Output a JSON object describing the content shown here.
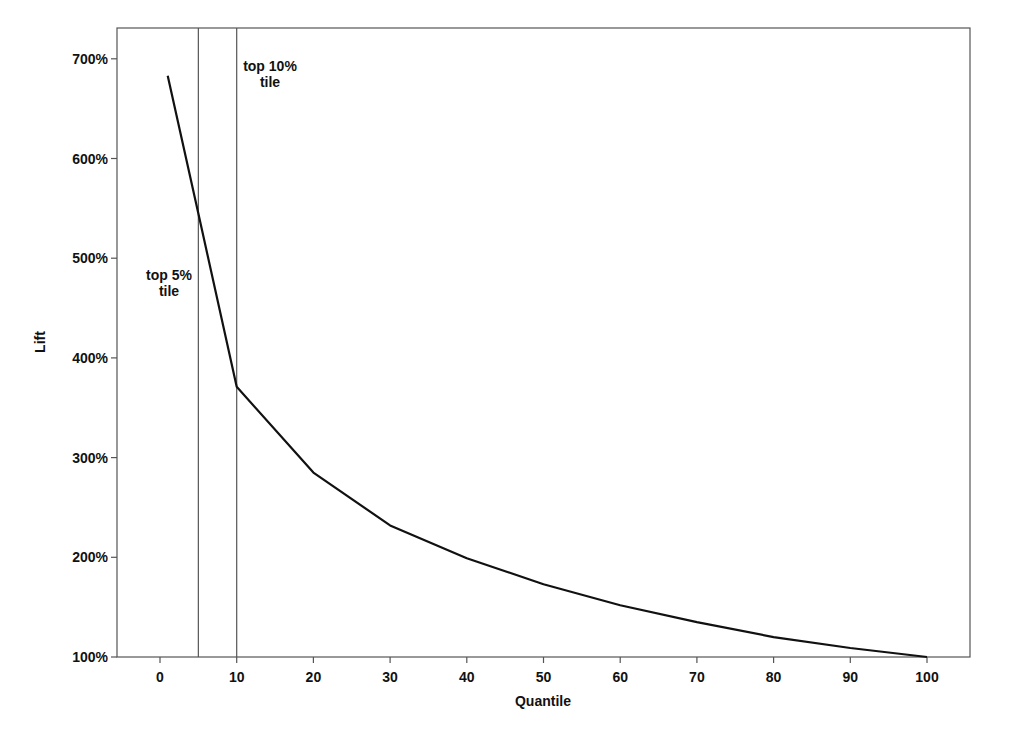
{
  "chart_data": {
    "type": "line",
    "title": "",
    "xlabel": "Quantile",
    "ylabel": "Lift",
    "x": [
      1,
      5,
      10,
      20,
      30,
      40,
      50,
      60,
      70,
      80,
      90,
      100
    ],
    "series": [
      {
        "name": "Lift",
        "values": [
          683,
          545,
          371,
          285,
          232,
          199,
          173,
          152,
          135,
          120,
          109,
          100
        ],
        "unit": "%"
      }
    ],
    "xticks": [
      0,
      10,
      20,
      30,
      40,
      50,
      60,
      70,
      80,
      90,
      100
    ],
    "xtick_labels": [
      "0",
      "10",
      "20",
      "30",
      "40",
      "50",
      "60",
      "70",
      "80",
      "90",
      "100"
    ],
    "yticks": [
      100,
      200,
      300,
      400,
      500,
      600,
      700
    ],
    "ytick_labels": [
      "100%",
      "200%",
      "300%",
      "400%",
      "500%",
      "600%",
      "700%"
    ],
    "xlim": [
      -5.5,
      105
    ],
    "ylim": [
      100,
      730
    ],
    "grid": false,
    "legend": null,
    "reference_lines": [
      {
        "x": 5,
        "label_line1": "top 5%",
        "label_line2": "tile"
      },
      {
        "x": 10,
        "label_line1": "top 10%",
        "label_line2": "tile"
      }
    ]
  },
  "colors": {
    "line": "#111111",
    "frame": "#555555",
    "background": "#ffffff"
  }
}
